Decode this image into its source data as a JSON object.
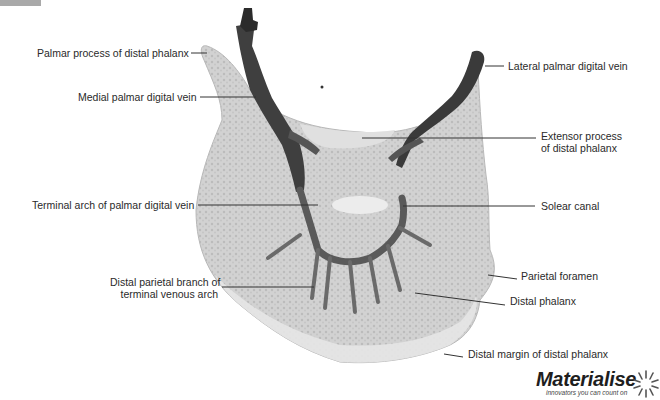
{
  "figure": {
    "type": "anatomical-illustration",
    "labels": {
      "palmar_process": "Palmar process of distal phalanx",
      "medial_vein": "Medial palmar digital vein",
      "terminal_arch": "Terminal arch of palmar digital vein",
      "distal_parietal_branch_l1": "Distal parietal branch of",
      "distal_parietal_branch_l2": "terminal venous arch",
      "lateral_vein": "Lateral palmar digital vein",
      "extensor_process_l1": "Extensor process",
      "extensor_process_l2": "of distal phalanx",
      "solear_canal": "Solear canal",
      "parietal_foramen": "Parietal foramen",
      "distal_phalanx": "Distal phalanx",
      "distal_margin": "Distal margin of distal phalanx"
    },
    "colors": {
      "bone_fill": "#cfcfcf",
      "bone_light": "#e4e4e4",
      "vein": "#4a4a4a",
      "vein_dark": "#2b2b2b",
      "leader_line": "#333333"
    }
  },
  "logo": {
    "wordmark": "Materialise",
    "tagline": "innovators you can count on"
  }
}
